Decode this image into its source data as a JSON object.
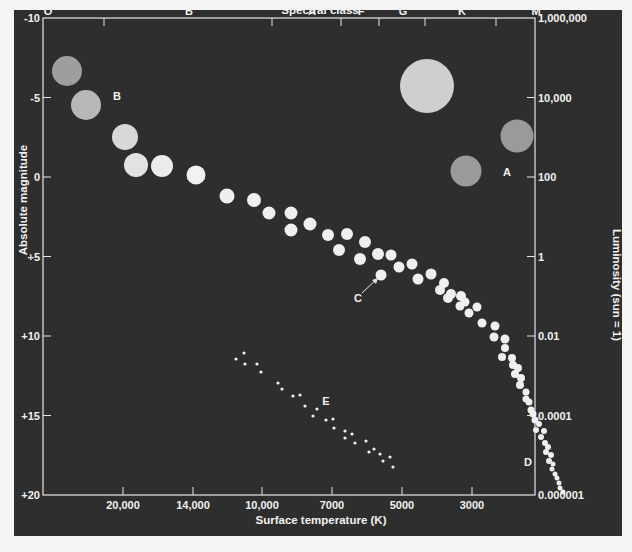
{
  "chart_data": {
    "type": "scatter",
    "top_axis": {
      "label": "Spectral class",
      "classes": [
        {
          "name": "O",
          "x": 48
        },
        {
          "name": "B",
          "x": 189
        },
        {
          "name": "A",
          "x": 312
        },
        {
          "name": "F",
          "x": 361
        },
        {
          "name": "G",
          "x": 403
        },
        {
          "name": "K",
          "x": 462
        },
        {
          "name": "M",
          "x": 536
        }
      ],
      "tick_x": [
        104,
        272,
        341,
        379,
        425,
        496
      ]
    },
    "left_axis": {
      "label": "Absolute magnitude",
      "ticks": [
        "-10",
        "-5",
        "0",
        "+5",
        "+10",
        "+15",
        "+20"
      ],
      "range": [
        -10,
        20
      ]
    },
    "right_axis": {
      "label": "Luminosity (sun = 1)",
      "ticks": [
        "1,000,000",
        "10,000",
        "100",
        "1",
        "0.01",
        "0.0001",
        "0.000001"
      ]
    },
    "bottom_axis": {
      "label": "Surface temperature (K)",
      "ticks": [
        {
          "label": "20,000",
          "x": 112
        },
        {
          "label": "14,000",
          "x": 182
        },
        {
          "label": "10,000",
          "x": 251
        },
        {
          "label": "7000",
          "x": 321
        },
        {
          "label": "5000",
          "x": 391
        },
        {
          "label": "3000",
          "x": 461
        }
      ]
    },
    "region_labels": [
      {
        "label": "A",
        "x": 507,
        "y": 176
      },
      {
        "label": "B",
        "x": 117,
        "y": 100
      },
      {
        "label": "C",
        "x": 358,
        "y": 302
      },
      {
        "label": "D",
        "x": 528,
        "y": 466
      },
      {
        "label": "E",
        "x": 326,
        "y": 405
      }
    ],
    "large_stars": [
      {
        "x": 67,
        "y": 71,
        "r": 15,
        "fill": "#9e9e9e"
      },
      {
        "x": 86,
        "y": 105,
        "r": 15,
        "fill": "#b8b8b8"
      },
      {
        "x": 125,
        "y": 137,
        "r": 13,
        "fill": "#d8d8d8"
      },
      {
        "x": 136,
        "y": 165,
        "r": 12,
        "fill": "#e2e2e2"
      },
      {
        "x": 162,
        "y": 166,
        "r": 11,
        "fill": "#ececec"
      },
      {
        "x": 196,
        "y": 175,
        "r": 9.5,
        "fill": "#f2f2f2"
      },
      {
        "x": 427,
        "y": 86,
        "r": 27,
        "fill": "#cfcfcf"
      },
      {
        "x": 517,
        "y": 136,
        "r": 16.5,
        "fill": "#9a9a9a"
      },
      {
        "x": 466,
        "y": 171,
        "r": 15.5,
        "fill": "#9a9a9a"
      }
    ],
    "main_sequence": [
      [
        227,
        196,
        7.5
      ],
      [
        254,
        200,
        7
      ],
      [
        269,
        213,
        6.5
      ],
      [
        291,
        213,
        6.5
      ],
      [
        291,
        230,
        6.5
      ],
      [
        310,
        224,
        6.5
      ],
      [
        328,
        235,
        6
      ],
      [
        347,
        234,
        6
      ],
      [
        339,
        250,
        6
      ],
      [
        365,
        242,
        6
      ],
      [
        360,
        259,
        6
      ],
      [
        378,
        254,
        6
      ],
      [
        391,
        255,
        5.5
      ],
      [
        381,
        275,
        5.5
      ],
      [
        399,
        267,
        5.5
      ],
      [
        412,
        264,
        5.5
      ],
      [
        418,
        279,
        5.5
      ],
      [
        431,
        274,
        5.5
      ],
      [
        444,
        283,
        5
      ],
      [
        440,
        290,
        5
      ],
      [
        451,
        294,
        5
      ],
      [
        448,
        298,
        5
      ],
      [
        461,
        296,
        5
      ],
      [
        465,
        302,
        4.5
      ],
      [
        460,
        306,
        4.5
      ],
      [
        477,
        307,
        4.5
      ],
      [
        469,
        313,
        4.5
      ],
      [
        482,
        323,
        4.5
      ],
      [
        495,
        326,
        4.5
      ],
      [
        494,
        337,
        4.5
      ],
      [
        505,
        339,
        4.5
      ],
      [
        505,
        348,
        4
      ],
      [
        502,
        357,
        4
      ],
      [
        512,
        358,
        4
      ],
      [
        513,
        365,
        4
      ],
      [
        518,
        368,
        4
      ],
      [
        515,
        374,
        4
      ],
      [
        521,
        378,
        4
      ],
      [
        520,
        385,
        4
      ],
      [
        526,
        392,
        3.5
      ],
      [
        526,
        399,
        3.5
      ],
      [
        529,
        402,
        3.5
      ],
      [
        531,
        410,
        3.5
      ],
      [
        533,
        414,
        3.5
      ],
      [
        535,
        420,
        3.5
      ],
      [
        539,
        424,
        3
      ],
      [
        536,
        430,
        3
      ],
      [
        544,
        431,
        3
      ],
      [
        541,
        437,
        3
      ],
      [
        545,
        443,
        3
      ],
      [
        548,
        447,
        3
      ],
      [
        546,
        452,
        3
      ],
      [
        551,
        455,
        3
      ],
      [
        549,
        461,
        3
      ],
      [
        553,
        464,
        2.5
      ],
      [
        552,
        469,
        2.5
      ],
      [
        555,
        474,
        2.5
      ],
      [
        557,
        478,
        2.5
      ],
      [
        559,
        483,
        2.5
      ],
      [
        560,
        488,
        2.5
      ],
      [
        563,
        492,
        2.5
      ]
    ],
    "white_dwarfs": [
      [
        236,
        359
      ],
      [
        244,
        353
      ],
      [
        245,
        364
      ],
      [
        257,
        364
      ],
      [
        261,
        372
      ],
      [
        278,
        383
      ],
      [
        282,
        389
      ],
      [
        293,
        396
      ],
      [
        300,
        395
      ],
      [
        305,
        406
      ],
      [
        317,
        409
      ],
      [
        313,
        416
      ],
      [
        326,
        420
      ],
      [
        333,
        419
      ],
      [
        334,
        428
      ],
      [
        345,
        431
      ],
      [
        345,
        438
      ],
      [
        352,
        434
      ],
      [
        355,
        443
      ],
      [
        366,
        441
      ],
      [
        369,
        452
      ],
      [
        374,
        449
      ],
      [
        380,
        454
      ],
      [
        383,
        461
      ],
      [
        390,
        457
      ],
      [
        393,
        467
      ]
    ],
    "arrow_C": {
      "x1": 362,
      "y1": 293,
      "x2": 378,
      "y2": 278
    },
    "colors": {
      "background": "#2e2e2e",
      "page": "#f4f4f2",
      "frame": "#e6e6e6",
      "text": "#f2f2f2"
    }
  }
}
